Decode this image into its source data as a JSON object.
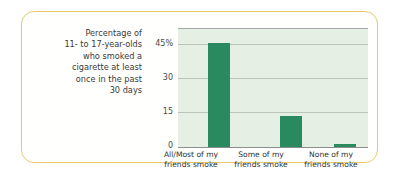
{
  "card": {
    "border_color": "#e8c96a",
    "background_color": "#fffffd"
  },
  "caption": {
    "lines": [
      "Percentage of",
      "11- to 17-year-olds",
      "who smoked a",
      "cigarette at least",
      "once in the past",
      "30 days"
    ]
  },
  "chart_data": {
    "type": "bar",
    "title": "",
    "subtitle": "",
    "xlabel": "",
    "ylabel": "Percentage of 11- to 17-year-olds who smoked a cigarette at least once in the past 30 days",
    "categories": [
      "All/Most of my friends smoke",
      "Some of my friends smoke",
      "None of my friends smoke"
    ],
    "category_lines": [
      [
        "All/Most of my",
        "friends smoke"
      ],
      [
        "Some of my",
        "friends smoke"
      ],
      [
        "None of my",
        "friends smoke"
      ]
    ],
    "values": [
      44,
      13,
      1
    ],
    "ylim": [
      0,
      50
    ],
    "yticks": [
      0,
      15,
      30,
      45
    ],
    "ytick_labels": [
      "0",
      "15",
      "30",
      "45%"
    ],
    "grid": true,
    "legend": "none",
    "bar_color": "#2a8a5f",
    "plot_background": "#e6efe4",
    "gridline_color": "#b9c6b7",
    "axis_color": "#8d8d8d"
  }
}
